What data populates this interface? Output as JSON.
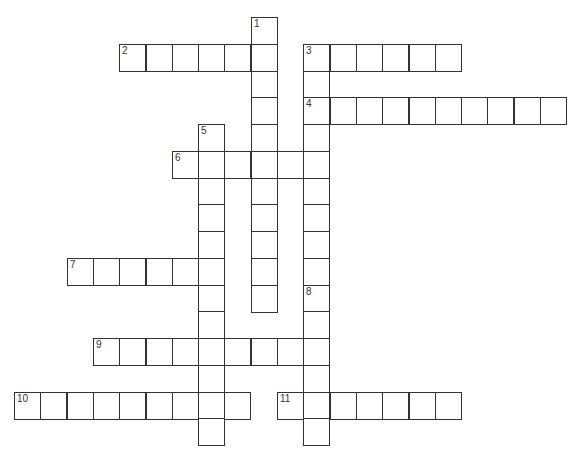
{
  "puzzle": {
    "type": "crossword",
    "origin": {
      "x": 14,
      "y": 17
    },
    "cell": {
      "w": 26.3,
      "h": 26.75
    },
    "colors": {
      "line": "#333333",
      "background": "#ffffff"
    },
    "words": [
      {
        "number": "1",
        "dir": "down",
        "row": 0,
        "col": 9,
        "length": 11
      },
      {
        "number": "2",
        "dir": "across",
        "row": 1,
        "col": 4,
        "length": 6
      },
      {
        "number": "3",
        "dir": "across",
        "row": 1,
        "col": 11,
        "length": 6
      },
      {
        "number": "3",
        "dir": "down",
        "row": 1,
        "col": 11,
        "length": 9
      },
      {
        "number": "4",
        "dir": "across",
        "row": 3,
        "col": 11,
        "length": 10
      },
      {
        "number": "5",
        "dir": "down",
        "row": 4,
        "col": 7,
        "length": 12
      },
      {
        "number": "6",
        "dir": "across",
        "row": 5,
        "col": 6,
        "length": 6
      },
      {
        "number": "7",
        "dir": "across",
        "row": 9,
        "col": 2,
        "length": 6
      },
      {
        "number": "8",
        "dir": "down",
        "row": 10,
        "col": 11,
        "length": 6
      },
      {
        "number": "9",
        "dir": "across",
        "row": 12,
        "col": 3,
        "length": 9
      },
      {
        "number": "10",
        "dir": "across",
        "row": 14,
        "col": 0,
        "length": 9
      },
      {
        "number": "11",
        "dir": "across",
        "row": 14,
        "col": 10,
        "length": 7
      }
    ]
  }
}
